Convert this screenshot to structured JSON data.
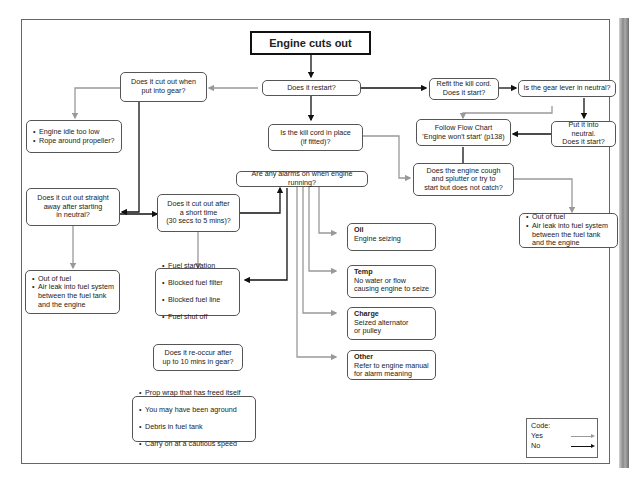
{
  "title": "Engine cuts out",
  "colors": {
    "yes": "#999999",
    "no": "#111111"
  },
  "nodes": {
    "restart": "Does it restart?",
    "cut_gear": "Does it cut out when\nput into gear?",
    "idle": [
      "Engine idle too low",
      "Rope around propeller?"
    ],
    "kill_cord": "Is the kill cord in place\n(if fitted)?",
    "refit": "Refit the kill cord.\nDoes it start?",
    "gear_neutral": "Is the gear lever in neutral?",
    "follow": "Follow Flow Chart\n'Engine won't start' (p138)",
    "put_neutral": "Put it into neutral.\nDoes it start?",
    "cough": "Does the engine cough\nand splutter or try to\nstart but does not catch?",
    "fuel_right": [
      "Out of fuel",
      "Air leak into fuel system\nbetween the fuel tank\nand the engine"
    ],
    "alarms": "Are any alarms on when engine running?",
    "straight_away": "Does it cut out straight\naway after starting\nin neutral?",
    "short_time": "Does it cut out after\na short time\n(30 secs to 5 mins)?",
    "fuel_left": [
      "Out of fuel",
      "Air leak into fuel system\nbetween the fuel tank\nand the engine"
    ],
    "starvation": [
      "Fuel starvation",
      "Blocked fuel filter",
      "Blocked fuel line",
      "Fuel shut off"
    ],
    "reoccur": "Does it re-occur after\nup to 10 mins in gear?",
    "prop": [
      "Prop wrap that has freed itself",
      "You may have been aground",
      "Debris in fuel tank",
      "Carry on at a cautious speed"
    ],
    "oil": {
      "head": "Oil",
      "body": "Engine seizing"
    },
    "temp": {
      "head": "Temp",
      "body": "No water or flow\ncausing engine to seize"
    },
    "charge": {
      "head": "Charge",
      "body": "Seized alternator\n or pulley"
    },
    "other": {
      "head": "Other",
      "body": "Refer to engine manual\nfor alarm meaning"
    }
  },
  "legend": {
    "title": "Code:",
    "yes": "Yes",
    "no": "No"
  }
}
